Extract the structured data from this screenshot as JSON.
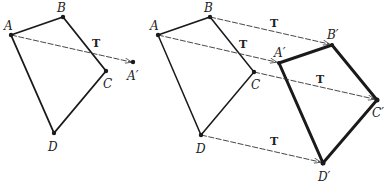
{
  "figure_left": {
    "points": {
      "A": {
        "label": "A",
        "x": 11,
        "y": 35
      },
      "B": {
        "label": "B",
        "x": 63,
        "y": 17
      },
      "C": {
        "label": "C",
        "x": 106,
        "y": 71
      },
      "D": {
        "label": "D",
        "x": 54,
        "y": 133
      },
      "A_prime": {
        "label": "A′",
        "x": 133,
        "y": 62
      }
    },
    "translation_label": "T"
  },
  "figure_right": {
    "original": {
      "A": {
        "label": "A"
      },
      "B": {
        "label": "B"
      },
      "C": {
        "label": "C"
      },
      "D": {
        "label": "D"
      }
    },
    "image": {
      "A_prime": {
        "label": "A′"
      },
      "B_prime": {
        "label": "B′"
      },
      "C_prime": {
        "label": "C′"
      },
      "D_prime": {
        "label": "D′"
      }
    },
    "translation_labels": [
      "T",
      "T",
      "T",
      "T"
    ]
  },
  "colors": {
    "stroke": "#1a1a1a",
    "vector": "#333333"
  }
}
